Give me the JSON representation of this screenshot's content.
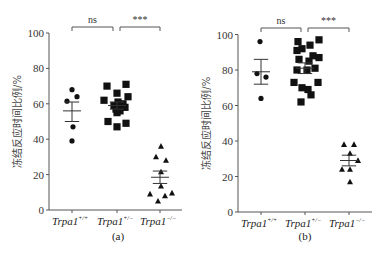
{
  "chart_data": [
    {
      "type": "scatter",
      "panel": "(a)",
      "ylabel": "冻结反应时间比例/%",
      "xlabel": "",
      "ylim": [
        0,
        100
      ],
      "yticks": [
        0,
        20,
        40,
        60,
        80,
        100
      ],
      "grid": false,
      "categories": [
        "Trpa1+/+",
        "Trpa1+/-",
        "Trpa1-/-"
      ],
      "series": [
        {
          "name": "Trpa1+/+",
          "marker": "circle",
          "values": [
            68,
            64,
            61.5,
            47,
            39
          ],
          "mean": 56,
          "sem": [
            50,
            61
          ]
        },
        {
          "name": "Trpa1+/-",
          "marker": "square",
          "values": [
            70,
            71,
            66,
            64,
            62,
            61,
            60,
            59,
            58,
            58,
            57,
            56,
            55,
            50,
            49,
            47
          ],
          "mean": 59,
          "sem": [
            57,
            61
          ]
        },
        {
          "name": "Trpa1-/-",
          "marker": "triangle",
          "values": [
            36,
            30,
            28,
            21.5,
            13.5,
            9,
            8,
            9.6,
            5
          ],
          "mean": 18.5,
          "sem": [
            15,
            22
          ]
        }
      ],
      "annotations": [
        {
          "from": "Trpa1+/+",
          "to": "Trpa1+/-",
          "text": "ns"
        },
        {
          "from": "Trpa1+/-",
          "to": "Trpa1-/-",
          "text": "***"
        }
      ]
    },
    {
      "type": "scatter",
      "panel": "(b)",
      "ylabel": "冻结反应时间比例/%",
      "xlabel": "",
      "ylim": [
        0,
        100
      ],
      "yticks": [
        0,
        20,
        40,
        60,
        80,
        100
      ],
      "grid": false,
      "categories": [
        "Trpa1+/+",
        "Trpa1+/-",
        "Trpa1-/-"
      ],
      "series": [
        {
          "name": "Trpa1+/+",
          "marker": "circle",
          "values": [
            96,
            78,
            76,
            64
          ],
          "mean": 79,
          "sem": [
            72,
            86
          ]
        },
        {
          "name": "Trpa1+/-",
          "marker": "square",
          "values": [
            96,
            94,
            97,
            91,
            92,
            88,
            87,
            86,
            85,
            80,
            80,
            81,
            73,
            70,
            69,
            73,
            66,
            62
          ],
          "mean": 81,
          "sem": [
            78,
            84
          ]
        },
        {
          "name": "Trpa1-/-",
          "marker": "triangle",
          "values": [
            38,
            38,
            33,
            29,
            24,
            24,
            17
          ],
          "mean": 29,
          "sem": [
            26,
            32
          ]
        }
      ],
      "annotations": [
        {
          "from": "Trpa1+/+",
          "to": "Trpa1+/-",
          "text": "ns"
        },
        {
          "from": "Trpa1+/-",
          "to": "Trpa1-/-",
          "text": "***"
        }
      ]
    }
  ],
  "labels": {
    "ylabel": "冻结反应时间比例/%",
    "groups": [
      {
        "base": "Trpa1",
        "sup": "+/+"
      },
      {
        "base": "Trpa1",
        "sup": "+/−"
      },
      {
        "base": "Trpa1",
        "sup": "−/−"
      }
    ],
    "captions": [
      "(a)",
      "(b)"
    ],
    "sig_ns": "ns",
    "sig_star": "***"
  },
  "layout": {
    "panels": [
      {
        "axis_x": 49,
        "axis_right": 182,
        "y0": 210,
        "y100": 33,
        "group_x": [
          72,
          117,
          160
        ],
        "xoffsets": [
          [
            0,
            5,
            -5,
            1,
            0
          ],
          [
            -10,
            9,
            0,
            11,
            -13,
            1,
            6,
            -3,
            4,
            8,
            -1,
            3,
            0,
            -9,
            9,
            0
          ],
          [
            1,
            -4,
            6,
            1,
            1,
            -10,
            5,
            12,
            -2
          ]
        ],
        "caption_x": 118,
        "caption_y": 240
      },
      {
        "axis_x": 238,
        "axis_right": 372,
        "y0": 212,
        "y100": 34.5,
        "group_x": [
          261,
          305,
          349
        ],
        "xoffsets": [
          [
            -1,
            -4,
            5,
            0
          ],
          [
            -7,
            5,
            14,
            -8,
            -3,
            8,
            14,
            -6,
            4,
            -8,
            2,
            10,
            -11,
            -3,
            3,
            13,
            6,
            -4
          ],
          [
            -5,
            5,
            1,
            9,
            -7,
            1,
            1
          ]
        ],
        "caption_x": 305,
        "caption_y": 240
      }
    ]
  }
}
